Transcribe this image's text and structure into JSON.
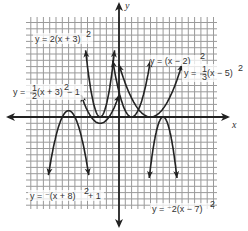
{
  "chart_data": {
    "type": "line",
    "title": "",
    "xlabel": "x",
    "ylabel": "y",
    "grid": true,
    "xlim": [
      -14,
      16
    ],
    "ylim": [
      -15,
      16
    ],
    "series": [
      {
        "name": "y = 2(x + 3)^2",
        "label": "y = 2(x + 3)²",
        "a": 2,
        "h": -3,
        "k": 0,
        "xrange": [
          -5.3,
          -0.7
        ]
      },
      {
        "name": "y = -1/2(x + 3)^2 - 1",
        "label": "y = −½(x + 3)² − 1",
        "a": 0.5,
        "h": -3,
        "k": -1,
        "xrange": [
          -6,
          0
        ]
      },
      {
        "name": "y = (x - 2)^2",
        "label": "y = (x − 2)²",
        "a": 1,
        "h": 2,
        "k": 0,
        "xrange": [
          -1,
          5
        ]
      },
      {
        "name": "y = 1/3(x - 5)^2",
        "label": "y = ⅓(x − 5)²",
        "a": 0.3333,
        "h": 5,
        "k": 0,
        "xrange": [
          0,
          10
        ]
      },
      {
        "name": "y = -(x + 8)^2 + 1",
        "label": "y = −(x + 8)² + 1",
        "a": -1,
        "h": -8,
        "k": 1,
        "xrange": [
          -11.2,
          -4.8
        ]
      },
      {
        "name": "y = -2(x - 7)^2",
        "label": "y = −2(x − 7)²",
        "a": -2,
        "h": 7,
        "k": 0,
        "xrange": [
          4.8,
          9.2
        ]
      }
    ]
  },
  "labels": {
    "x_axis": "x",
    "y_axis": "y",
    "eq1": "y = 2(x + 3)",
    "eq2a": "y = ",
    "eq2b": "(x + 3)",
    "eq2c": " − 1",
    "eq3": "y = (x − 2)",
    "eq4a": "y = ",
    "eq4b": "(x − 5)",
    "eq5": "y = ⁻(x + 8)",
    "eq5b": " + 1",
    "eq6": "y = ⁻2(x − 7)",
    "sq": "2",
    "frac_top_2": "1",
    "frac_bot_2": "2",
    "frac_top_4": "1",
    "frac_bot_4": "3"
  }
}
